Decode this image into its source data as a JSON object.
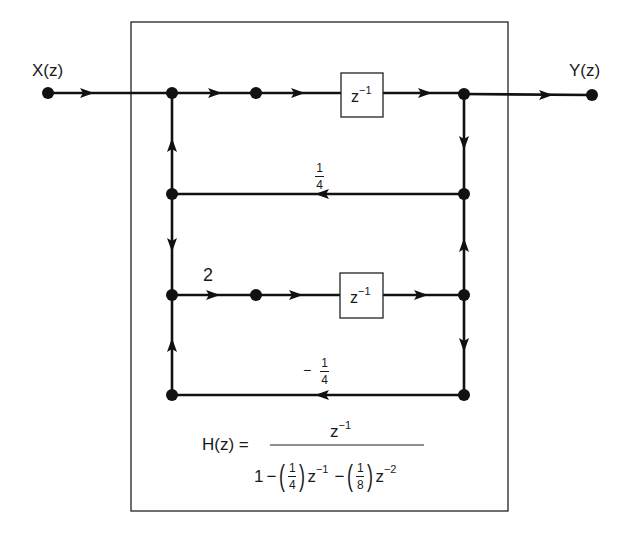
{
  "diagram": {
    "type": "signal-flow-graph",
    "input": {
      "label": "X(z)"
    },
    "output": {
      "label": "Y(z)"
    },
    "delays": [
      {
        "label": "z",
        "exponent": "−1"
      },
      {
        "label": "z",
        "exponent": "−1"
      }
    ],
    "gains": {
      "branch_upper_feedback": {
        "sign": "",
        "numerator": "1",
        "denominator": "4"
      },
      "branch_lower_forward": "2",
      "branch_lower_feedback": {
        "sign": "−",
        "numerator": "1",
        "denominator": "4"
      }
    },
    "transfer_function": {
      "lhs": "H(z) =",
      "numerator": {
        "base": "z",
        "exponent": "−1"
      },
      "denominator": {
        "const": "1",
        "op1": "−",
        "coef1": {
          "numerator": "1",
          "denominator": "4"
        },
        "term1": {
          "base": "z",
          "exponent": "−1"
        },
        "op2": "−",
        "coef2": {
          "numerator": "1",
          "denominator": "8"
        },
        "term2": {
          "base": "z",
          "exponent": "−2"
        }
      }
    },
    "colors": {
      "line": "#111111",
      "background": "#ffffff"
    }
  }
}
